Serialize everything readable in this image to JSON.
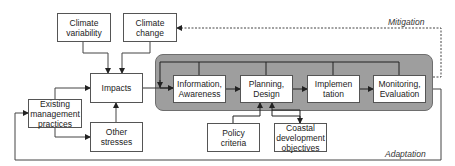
{
  "diagram": {
    "nodes": {
      "climate_variability": "Climate\nvariability",
      "climate_change": "Climate\nchange",
      "impacts": "Impacts",
      "existing_management": "Existing\nmanagement\npractices",
      "other_stresses": "Other\nstresses",
      "information": "Information,\nAwareness",
      "planning": "Planning,\nDesign",
      "implementation": "Implemen\ntation",
      "monitoring": "Monitoring,\nEvaluation",
      "policy_criteria": "Policy\ncriteria",
      "coastal_objectives": "Coastal\ndevelopment\nobjectives"
    },
    "labels": {
      "mitigation": "Mitigation",
      "adaptation": "Adaptation"
    },
    "edges": [
      {
        "from": "climate_variability",
        "to": "impacts"
      },
      {
        "from": "climate_change",
        "to": "impacts"
      },
      {
        "from": "existing_management",
        "to": "impacts"
      },
      {
        "from": "existing_management",
        "to": "other_stresses"
      },
      {
        "from": "other_stresses",
        "to": "impacts"
      },
      {
        "from": "impacts",
        "to": "information"
      },
      {
        "from": "information",
        "to": "planning"
      },
      {
        "from": "planning",
        "to": "implementation"
      },
      {
        "from": "implementation",
        "to": "monitoring"
      },
      {
        "from": "policy_criteria",
        "to": "planning"
      },
      {
        "from": "planning",
        "to": "coastal_objectives",
        "bidirectional": true
      },
      {
        "from": "monitoring",
        "to": "climate_change",
        "label": "Mitigation",
        "style": "dashed"
      },
      {
        "from": "monitoring",
        "to": "existing_management",
        "label": "Adaptation"
      },
      {
        "from": "panel_feedback",
        "to": "information",
        "note": "internal feedback loop from all stages"
      }
    ],
    "colors": {
      "panel": "#9e9e9e",
      "box_border": "#555555",
      "line": "#333333"
    }
  }
}
